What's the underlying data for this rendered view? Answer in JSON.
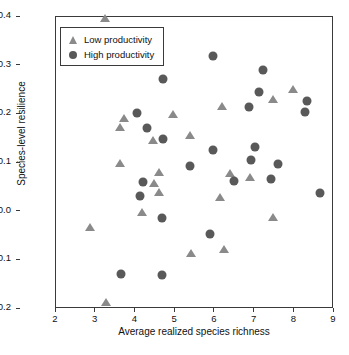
{
  "chart_data": {
    "type": "scatter",
    "title": "",
    "xlabel": "Average realized species richness",
    "ylabel": "Species-level resilience",
    "xlim": [
      2,
      9
    ],
    "ylim": [
      -0.2,
      0.4
    ],
    "xticks": [
      "2",
      "3",
      "4",
      "5",
      "6",
      "7",
      "8",
      "9"
    ],
    "yticks": [
      "−0.2",
      "−0.1",
      "0.0",
      "0.1",
      "0.2",
      "0.3",
      "0.4"
    ],
    "grid": false,
    "legend_position": "top-left",
    "series": [
      {
        "name": "Low productivity",
        "marker": "triangle",
        "color": "#8a8a8a",
        "points": [
          [
            3.24,
            0.398
          ],
          [
            2.85,
            -0.031
          ],
          [
            3.25,
            -0.186
          ],
          [
            3.62,
            0.175
          ],
          [
            3.7,
            0.192
          ],
          [
            3.61,
            0.1
          ],
          [
            4.17,
            0.0
          ],
          [
            4.45,
            0.148
          ],
          [
            4.48,
            0.058
          ],
          [
            4.6,
            0.082
          ],
          [
            4.6,
            0.04
          ],
          [
            4.95,
            0.201
          ],
          [
            5.38,
            0.157
          ],
          [
            5.4,
            -0.085
          ],
          [
            6.19,
            0.217
          ],
          [
            6.22,
            -0.077
          ],
          [
            6.12,
            0.031
          ],
          [
            6.38,
            0.079
          ],
          [
            6.88,
            0.071
          ],
          [
            7.46,
            0.231
          ],
          [
            7.47,
            -0.011
          ],
          [
            7.97,
            0.253
          ]
        ]
      },
      {
        "name": "High productivity",
        "marker": "circle",
        "color": "#595959",
        "points": [
          [
            4.03,
            0.203
          ],
          [
            4.28,
            0.172
          ],
          [
            4.7,
            0.273
          ],
          [
            4.69,
            0.15
          ],
          [
            4.19,
            0.06
          ],
          [
            4.11,
            0.033
          ],
          [
            4.67,
            -0.012
          ],
          [
            3.63,
            -0.128
          ],
          [
            4.67,
            -0.13
          ],
          [
            5.37,
            0.093
          ],
          [
            5.95,
            0.32
          ],
          [
            5.96,
            0.126
          ],
          [
            5.88,
            -0.045
          ],
          [
            6.48,
            0.064
          ],
          [
            6.86,
            0.215
          ],
          [
            6.9,
            0.107
          ],
          [
            7.0,
            0.133
          ],
          [
            7.11,
            0.246
          ],
          [
            7.21,
            0.292
          ],
          [
            7.42,
            0.067
          ],
          [
            7.59,
            0.098
          ],
          [
            8.28,
            0.204
          ],
          [
            8.33,
            0.228
          ],
          [
            8.66,
            0.038
          ]
        ]
      }
    ]
  },
  "legend": {
    "items": [
      {
        "label": "Low productivity",
        "marker": "triangle"
      },
      {
        "label": "High productivity",
        "marker": "circle"
      }
    ]
  }
}
